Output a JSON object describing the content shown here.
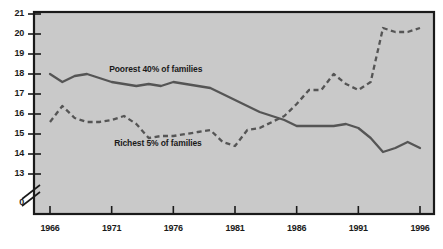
{
  "figure": {
    "title_partial": "",
    "background_color": "#ffffff",
    "plot_background_color": "#c9c9c9",
    "line_color": "#555555",
    "axis_color": "#1a1a1a"
  },
  "chart_data": {
    "type": "line",
    "title": "",
    "xlabel": "",
    "ylabel": "",
    "xlim": [
      1966,
      1996
    ],
    "ylim": [
      13,
      21
    ],
    "y_axis_break": true,
    "y_axis_break_note": "axis broken between 13 and 0",
    "grid": false,
    "legend": "inline-labels",
    "y_tick_labels": [
      "21",
      "20",
      "19",
      "18",
      "17",
      "16",
      "15",
      "14",
      "13",
      "0"
    ],
    "y_ticks": [
      21,
      20,
      19,
      18,
      17,
      16,
      15,
      14,
      13,
      0
    ],
    "x_tick_labels": [
      "1966",
      "1971",
      "1976",
      "1981",
      "1986",
      "1991",
      "1996"
    ],
    "x_ticks": [
      1966,
      1971,
      1976,
      1981,
      1986,
      1991,
      1996
    ],
    "x": [
      1966,
      1967,
      1968,
      1969,
      1970,
      1971,
      1972,
      1973,
      1974,
      1975,
      1976,
      1977,
      1978,
      1979,
      1980,
      1981,
      1982,
      1983,
      1984,
      1985,
      1986,
      1987,
      1988,
      1989,
      1990,
      1991,
      1992,
      1993,
      1994,
      1995,
      1996
    ],
    "series": [
      {
        "name": "Poorest 40% of families",
        "style": "solid",
        "label_position": {
          "x": 1970.8,
          "y": 18.25
        },
        "values": [
          18.0,
          17.6,
          17.9,
          18.0,
          17.8,
          17.6,
          17.5,
          17.4,
          17.5,
          17.4,
          17.6,
          17.5,
          17.4,
          17.3,
          17.0,
          16.7,
          16.4,
          16.1,
          15.9,
          15.7,
          15.4,
          15.4,
          15.4,
          15.4,
          15.5,
          15.3,
          14.8,
          14.1,
          14.3,
          14.6,
          14.3
        ]
      },
      {
        "name": "Richest 5% of families",
        "style": "dashed",
        "label_position": {
          "x": 1971.2,
          "y": 14.55
        },
        "values": [
          15.6,
          16.4,
          15.8,
          15.6,
          15.6,
          15.7,
          15.9,
          15.5,
          14.8,
          14.9,
          14.9,
          15.0,
          15.1,
          15.2,
          14.6,
          14.4,
          15.2,
          15.3,
          15.6,
          15.9,
          16.5,
          17.2,
          17.2,
          18.0,
          17.5,
          17.2,
          17.6,
          20.3,
          20.1,
          20.1,
          20.3
        ]
      }
    ]
  },
  "series_labels": {
    "poorest": "Poorest 40% of families",
    "richest": "Richest 5% of families"
  }
}
